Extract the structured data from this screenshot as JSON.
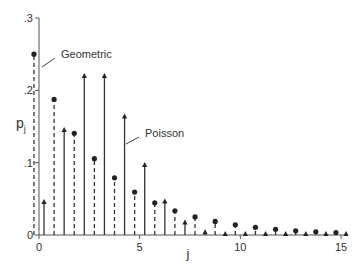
{
  "chart_data": {
    "type": "scatter",
    "subtype": "stem",
    "title": "",
    "xlabel": "j",
    "ylabel": "p",
    "ylabel_subscript": "j",
    "xlim": [
      0,
      15
    ],
    "ylim": [
      0,
      0.3
    ],
    "x_ticks": [
      0,
      5,
      10,
      15
    ],
    "x_tick_labels": [
      "0",
      "5",
      "10",
      "15"
    ],
    "y_ticks": [
      0,
      0.1,
      0.2,
      0.3
    ],
    "y_tick_labels": [
      "0",
      ".1",
      ".2",
      ".3"
    ],
    "grid": false,
    "legend": "annotations",
    "x": [
      0,
      1,
      2,
      3,
      4,
      5,
      6,
      7,
      8,
      9,
      10,
      11,
      12,
      13,
      14,
      15
    ],
    "series": [
      {
        "name": "Geometric",
        "style": "dashed-stem-dot",
        "offset": -0.25,
        "values": [
          0.25,
          0.1875,
          0.1406,
          0.1055,
          0.0791,
          0.0593,
          0.0445,
          0.0334,
          0.025,
          0.0188,
          0.0141,
          0.0106,
          0.0079,
          0.0059,
          0.0045,
          0.0033
        ]
      },
      {
        "name": "Poisson",
        "style": "solid-stem-arrow",
        "offset": 0.25,
        "values": [
          0.0498,
          0.1494,
          0.224,
          0.224,
          0.168,
          0.1008,
          0.0504,
          0.0216,
          0.0081,
          0.0027,
          0.0008,
          0.0002,
          0.0001,
          0.0,
          0.0,
          0.0
        ]
      }
    ],
    "annotations": [
      {
        "text": "Geometric",
        "series": "Geometric"
      },
      {
        "text": "Poisson",
        "series": "Poisson"
      }
    ]
  }
}
